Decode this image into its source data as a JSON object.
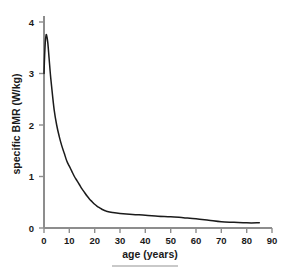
{
  "chart_data": {
    "type": "line",
    "title": "",
    "subtitle": "",
    "xlabel": "age (years)",
    "ylabel": "specific BMR (W/kg)",
    "xlim": [
      0,
      92
    ],
    "ylim": [
      0,
      4.25
    ],
    "xticks": [
      0,
      10,
      20,
      30,
      40,
      50,
      60,
      70,
      80,
      90
    ],
    "xtick_labels": [
      "0",
      "10",
      "20",
      "30",
      "40",
      "50",
      "60",
      "70",
      "80",
      "90"
    ],
    "yticks": [
      0,
      1,
      2,
      3,
      4
    ],
    "ytick_labels": [
      "0",
      "1",
      "2",
      "3",
      "4"
    ],
    "grid": false,
    "legend": false,
    "legend_position": "none",
    "series": [
      {
        "name": "specific BMR",
        "color": "#1b1b1b",
        "x": [
          0,
          0.25,
          0.5,
          0.75,
          1,
          1.5,
          2,
          2.5,
          3,
          4,
          5,
          6,
          7,
          8,
          9,
          10,
          11,
          12,
          13,
          14,
          15,
          16,
          17,
          18,
          19,
          20,
          21,
          22,
          23,
          24,
          25,
          27,
          30,
          35,
          40,
          45,
          50,
          55,
          60,
          65,
          70,
          75,
          80,
          85
        ],
        "y": [
          3.0,
          3.35,
          3.6,
          3.72,
          3.75,
          3.6,
          3.3,
          3.0,
          2.75,
          2.3,
          2.0,
          1.78,
          1.6,
          1.45,
          1.3,
          1.2,
          1.1,
          1.0,
          0.92,
          0.84,
          0.76,
          0.69,
          0.62,
          0.56,
          0.51,
          0.46,
          0.42,
          0.39,
          0.36,
          0.34,
          0.32,
          0.3,
          0.28,
          0.26,
          0.25,
          0.23,
          0.22,
          0.2,
          0.18,
          0.15,
          0.12,
          0.11,
          0.1,
          0.1
        ]
      }
    ],
    "annotations": []
  },
  "footer": {
    "rule": ""
  }
}
